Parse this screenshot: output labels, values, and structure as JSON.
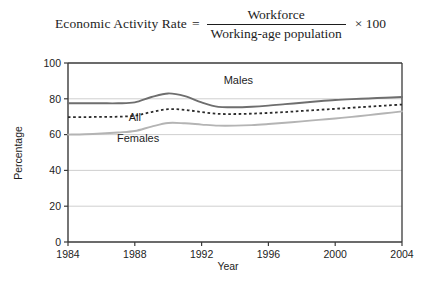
{
  "formula": {
    "lead": "Economic Activity Rate",
    "equals": "=",
    "numerator": "Workforce",
    "denominator": "Working-age population",
    "tail": "× 100"
  },
  "chart_data": {
    "type": "line",
    "title": "",
    "xlabel": "Year",
    "ylabel": "Percentage",
    "xlim": [
      1984,
      2004
    ],
    "ylim": [
      0,
      100
    ],
    "xticks": [
      1984,
      1988,
      1992,
      1996,
      2000,
      2004
    ],
    "xticklabels": [
      "1984",
      "1988",
      "1992",
      "1996",
      "2000",
      "2004"
    ],
    "yticks": [
      0,
      20,
      40,
      60,
      80,
      100
    ],
    "yticklabels": [
      "0",
      "20",
      "40",
      "60",
      "80",
      "100"
    ],
    "grid": "horizontal",
    "legend_position": "inline-annotations",
    "x": [
      1984,
      1985,
      1986,
      1987,
      1988,
      1989,
      1990,
      1991,
      1992,
      1993,
      1994,
      1995,
      1996,
      1997,
      1998,
      1999,
      2000,
      2001,
      2002,
      2003,
      2004
    ],
    "series": [
      {
        "name": "Males",
        "color": "#6e6e6e",
        "style": "solid",
        "values": [
          77.5,
          77.5,
          77.5,
          77.5,
          78.0,
          81.0,
          83.0,
          81.5,
          78.0,
          75.5,
          75.3,
          75.6,
          76.2,
          77.0,
          77.8,
          78.6,
          79.3,
          79.8,
          80.2,
          80.6,
          81.0
        ]
      },
      {
        "name": "All",
        "color": "#2b2b2b",
        "style": "dotted",
        "values": [
          69.8,
          69.8,
          69.9,
          70.0,
          70.6,
          72.6,
          74.2,
          73.8,
          72.6,
          71.6,
          71.5,
          71.7,
          72.1,
          72.6,
          73.2,
          73.8,
          74.4,
          75.0,
          75.6,
          76.2,
          76.8
        ]
      },
      {
        "name": "Females",
        "color": "#b4b4b4",
        "style": "solid",
        "values": [
          60.0,
          60.2,
          60.6,
          61.2,
          62.0,
          64.5,
          66.5,
          66.3,
          65.6,
          65.0,
          65.0,
          65.3,
          65.9,
          66.6,
          67.4,
          68.2,
          69.0,
          69.9,
          70.9,
          71.9,
          73.0
        ]
      }
    ],
    "annotations": [
      {
        "text": "Males",
        "x": 1994.2,
        "y": 88.5
      },
      {
        "text": "All",
        "x": 1988.0,
        "y": 67.5
      },
      {
        "text": "Females",
        "x": 1988.2,
        "y": 56.0
      }
    ]
  }
}
